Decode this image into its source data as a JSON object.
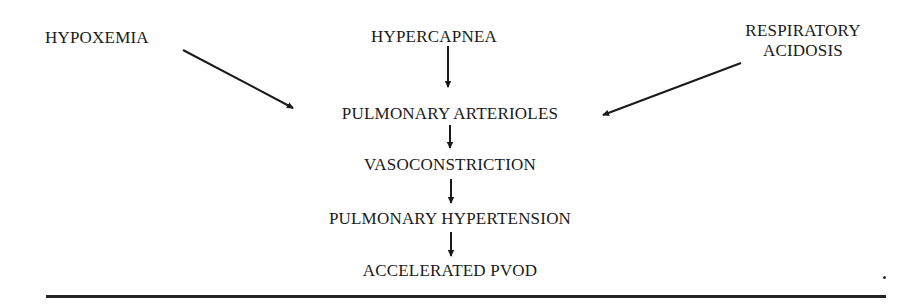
{
  "diagram": {
    "causes": {
      "hypoxemia": "HYPOXEMIA",
      "hypercapnea": "HYPERCAPNEA",
      "respiratory_acidosis_line1": "RESPIRATORY",
      "respiratory_acidosis_line2": "ACIDOSIS"
    },
    "chain": [
      {
        "label": "PULMONARY ARTERIOLES"
      },
      {
        "label": "VASOCONSTRICTION"
      },
      {
        "label": "PULMONARY HYPERTENSION"
      },
      {
        "label": "ACCELERATED PVOD"
      }
    ],
    "edges": [
      {
        "from": "HYPOXEMIA",
        "to": "PULMONARY ARTERIOLES"
      },
      {
        "from": "HYPERCAPNEA",
        "to": "PULMONARY ARTERIOLES"
      },
      {
        "from": "RESPIRATORY ACIDOSIS",
        "to": "PULMONARY ARTERIOLES"
      },
      {
        "from": "PULMONARY ARTERIOLES",
        "to": "VASOCONSTRICTION"
      },
      {
        "from": "VASOCONSTRICTION",
        "to": "PULMONARY HYPERTENSION"
      },
      {
        "from": "PULMONARY HYPERTENSION",
        "to": "ACCELERATED PVOD"
      }
    ],
    "colors": {
      "ink": "#1a1a1a",
      "background": "#ffffff"
    }
  }
}
